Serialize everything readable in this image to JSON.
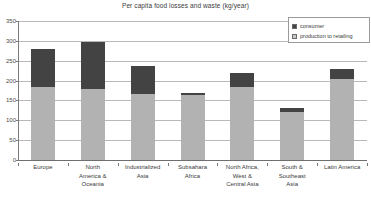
{
  "chart_data": {
    "type": "bar",
    "subtype": "stacked-vertical",
    "title": "Per capita food losses and waste (kg/year)",
    "xlabel": "",
    "ylabel": "",
    "ylim": [
      0,
      350
    ],
    "yticks": [
      0,
      50,
      100,
      150,
      200,
      250,
      300,
      350
    ],
    "ytick_labels": [
      "0",
      "50",
      "100",
      "150",
      "200",
      "250",
      "300",
      "350"
    ],
    "grid": true,
    "legend_position": "top-right",
    "categories": [
      "Europe",
      "North America & Oceania",
      "Industrialized Asia",
      "Subsahara Africa",
      "North Africa, West & Central Asia",
      "South & Southeast Asia",
      "Latin America"
    ],
    "category_lines": [
      [
        "Europe"
      ],
      [
        "North",
        "America &",
        "Oceania"
      ],
      [
        "Industrialized",
        "Asia"
      ],
      [
        "Subsahara",
        "Africa"
      ],
      [
        "North Africa,",
        "West &",
        "Central Asia"
      ],
      [
        "South &",
        "Southeast",
        "Asia"
      ],
      [
        "Latin America"
      ]
    ],
    "series": [
      {
        "name": "production to retailing",
        "color": "#b2b2b2",
        "values": [
          185,
          180,
          165,
          164,
          185,
          122,
          204
        ]
      },
      {
        "name": "consumer",
        "color": "#434343",
        "values": [
          95,
          118,
          73,
          6,
          33,
          10,
          24
        ]
      }
    ],
    "totals": [
      280,
      298,
      238,
      170,
      218,
      132,
      228
    ]
  },
  "legend": {
    "items": [
      {
        "label": "consumer",
        "color": "#434343"
      },
      {
        "label": "production to retailing",
        "color": "#c8c8c8"
      }
    ]
  }
}
